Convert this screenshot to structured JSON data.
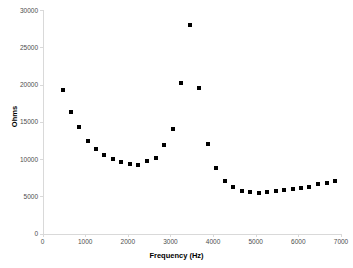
{
  "chart_data": {
    "type": "scatter",
    "title": "",
    "xlabel": "Frequency (Hz)",
    "ylabel": "Ohms",
    "xlim": [
      0,
      7000
    ],
    "ylim": [
      0,
      30000
    ],
    "xticks": [
      0,
      1000,
      2000,
      3000,
      4000,
      5000,
      6000,
      7000
    ],
    "yticks": [
      0,
      5000,
      10000,
      15000,
      20000,
      25000,
      30000
    ],
    "xtick_labels": [
      "0",
      "1000",
      "2000",
      "3000",
      "4000",
      "5000",
      "6000",
      "7000"
    ],
    "ytick_labels": [
      "0",
      "5000",
      "10000",
      "15000",
      "20000",
      "25000",
      "30000"
    ],
    "grid": false,
    "legend": null,
    "marker": "square",
    "marker_color": "#000000",
    "series": [
      {
        "name": "Impedance",
        "x": [
          470,
          670,
          860,
          1060,
          1250,
          1450,
          1650,
          1850,
          2050,
          2250,
          2450,
          2650,
          2860,
          3060,
          3250,
          3470,
          3680,
          3880,
          4080,
          4270,
          4470,
          4670,
          4870,
          5070,
          5270,
          5470,
          5670,
          5870,
          6060,
          6260,
          6460,
          6660,
          6860
        ],
        "y": [
          19200,
          16300,
          14300,
          12400,
          11300,
          10500,
          10000,
          9600,
          9350,
          9250,
          9700,
          10200,
          11900,
          14000,
          20200,
          28000,
          19500,
          11950,
          8750,
          7100,
          6300,
          5650,
          5600,
          5450,
          5550,
          5650,
          5800,
          5950,
          6150,
          6300,
          6600,
          6800,
          7050
        ]
      }
    ]
  }
}
